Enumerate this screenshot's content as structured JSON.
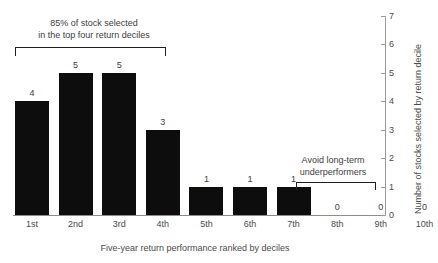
{
  "chart_data": {
    "type": "bar",
    "title": "",
    "xlabel": "Five-year return performance ranked by deciles",
    "ylabel": "Number of stocks selected by return decile",
    "categories": [
      "1st",
      "2nd",
      "3rd",
      "4th",
      "5th",
      "6th",
      "7th",
      "8th",
      "9th",
      "10th"
    ],
    "values": [
      4,
      5,
      5,
      3,
      1,
      1,
      1,
      0,
      0,
      0
    ],
    "value_labels": [
      "4",
      "5",
      "5",
      "3",
      "1",
      "1",
      "1",
      "0",
      "0",
      "0"
    ],
    "ylim": [
      0,
      7
    ],
    "yticks": [
      0,
      1,
      2,
      3,
      4,
      5,
      6,
      7
    ],
    "ytick_labels": [
      "0",
      "1",
      "2",
      "3",
      "4",
      "5",
      "6",
      "7"
    ],
    "y_axis_position": "right",
    "grid": false,
    "legend": null,
    "bar_color": "#0d0d0d",
    "axis_color": "#9a9a9a",
    "text_color": "#4a4a4a",
    "annotations": [
      {
        "id": "top-deciles",
        "text": "85% of stock selected\nin the top four return deciles",
        "bracket_span_categories": [
          "1st",
          "4th"
        ]
      },
      {
        "id": "bottom-deciles",
        "text": "Avoid long-term\nunderperformers",
        "bracket_span_categories": [
          "8th",
          "10th"
        ]
      }
    ]
  },
  "bars": [
    {
      "category": "1st",
      "value": 4,
      "label": "4"
    },
    {
      "category": "2nd",
      "value": 5,
      "label": "5"
    },
    {
      "category": "3rd",
      "value": 5,
      "label": "5"
    },
    {
      "category": "4th",
      "value": 3,
      "label": "3"
    },
    {
      "category": "5th",
      "value": 1,
      "label": "1"
    },
    {
      "category": "6th",
      "value": 1,
      "label": "1"
    },
    {
      "category": "7th",
      "value": 1,
      "label": "1"
    },
    {
      "category": "8th",
      "value": 0,
      "label": "0"
    },
    {
      "category": "9th",
      "value": 0,
      "label": "0"
    },
    {
      "category": "10th",
      "value": 0,
      "label": "0"
    }
  ],
  "yticks": [
    {
      "value": 7,
      "label": "7"
    },
    {
      "value": 6,
      "label": "6"
    },
    {
      "value": 5,
      "label": "5"
    },
    {
      "value": 4,
      "label": "4"
    },
    {
      "value": 3,
      "label": "3"
    },
    {
      "value": 2,
      "label": "2"
    },
    {
      "value": 1,
      "label": "1"
    },
    {
      "value": 0,
      "label": "0"
    }
  ],
  "axis_titles": {
    "x": "Five-year return performance ranked by deciles",
    "y": "Number of stocks selected by return decile"
  },
  "annotations": {
    "left": {
      "line1": "85% of stock selected",
      "line2": "in the top four return deciles"
    },
    "right": {
      "line1": "Avoid long-term",
      "line2": "underperformers"
    }
  }
}
